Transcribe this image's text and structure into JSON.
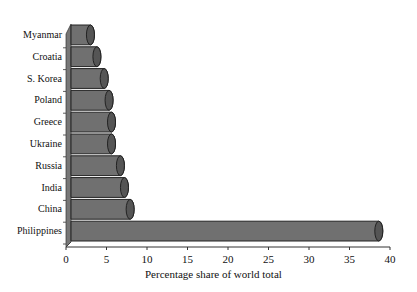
{
  "chart_data": {
    "type": "bar",
    "orientation": "horizontal",
    "style": "3d-cylinder",
    "title": "",
    "xlabel": "Percentage share of world total",
    "ylabel": "",
    "categories": [
      "Philippines",
      "China",
      "India",
      "Russia",
      "Ukraine",
      "Greece",
      "Poland",
      "S. Korea",
      "Croatia",
      "Myanmar"
    ],
    "values": [
      38.0,
      7.3,
      6.6,
      6.1,
      5.0,
      5.0,
      4.7,
      4.1,
      3.2,
      2.4
    ],
    "xlim": [
      0,
      40
    ],
    "xticks": [
      "0",
      "5",
      "10",
      "15",
      "20",
      "25",
      "30",
      "35",
      "40"
    ],
    "grid": false,
    "legend": "none",
    "bar_color": "#707070"
  }
}
